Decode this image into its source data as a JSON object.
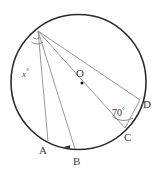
{
  "figure": {
    "kind": "circle-geometry-diagram",
    "background_color": "#ffffff",
    "stroke_colors": {
      "circle": "#2b2b2b",
      "chord": "#8c8c8c",
      "arc_mark": "#6e6e6e",
      "label_text": "#3b3b3b",
      "center_dot": "#1a1a1a"
    },
    "circle": {
      "center_x": 78.5,
      "center_y": 82,
      "radius": 67.5,
      "stroke_width": 1.6
    },
    "center_point": {
      "label": "O",
      "x": 82,
      "y": 83,
      "label_x": 76,
      "label_y": 68,
      "dot_radius": 1.5
    },
    "points": [
      {
        "name": "P",
        "label": "",
        "x": 38,
        "y": 31,
        "label_x": 0,
        "label_y": 0,
        "on_circle": true
      },
      {
        "name": "A",
        "label": "A",
        "x": 48,
        "y": 141,
        "label_x": 39,
        "label_y": 145,
        "on_circle": true
      },
      {
        "name": "B",
        "label": "B",
        "x": 75,
        "y": 149,
        "label_x": 73,
        "label_y": 156,
        "on_circle": true
      },
      {
        "name": "C",
        "label": "C",
        "x": 125,
        "y": 128,
        "label_x": 124,
        "label_y": 132,
        "on_circle": true
      },
      {
        "name": "D",
        "label": "D",
        "x": 140,
        "y": 100,
        "label_x": 143,
        "label_y": 99,
        "on_circle": true
      }
    ],
    "segments": [
      {
        "name": "P-A",
        "from": "P",
        "to": "A"
      },
      {
        "name": "P-B",
        "from": "P",
        "to": "B"
      },
      {
        "name": "P-C",
        "from": "P",
        "to": "C"
      },
      {
        "name": "P-D",
        "from": "P",
        "to": "D"
      },
      {
        "name": "C-D",
        "from": "C",
        "to": "D"
      }
    ],
    "angles": [
      {
        "name": "angle-x-at-P",
        "label": "x",
        "degree_symbol": "°",
        "vertex": "P",
        "label_x": 22,
        "label_y": 68,
        "arc_radius": 14,
        "between": [
          "P-A",
          "P-B"
        ]
      },
      {
        "name": "angle-70-at-C",
        "label": "70",
        "degree_symbol": "°",
        "vertex": "C",
        "label_x": 112,
        "label_y": 107,
        "arc_radius": 18,
        "between": [
          "C-P",
          "C-D"
        ]
      }
    ],
    "arc_marks_at_apex": [
      {
        "name": "apex-arc-inner",
        "radius": 7
      },
      {
        "name": "apex-arc-outer",
        "radius": 12
      }
    ],
    "arrow_marker": {
      "name": "arc-direction-arrow",
      "x": 66,
      "y": 146,
      "points_left": true
    }
  }
}
